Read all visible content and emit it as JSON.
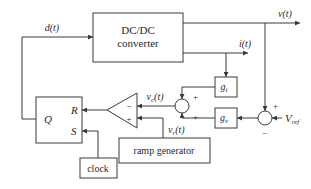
{
  "diagram": {
    "type": "block-diagram",
    "blocks": {
      "converter": {
        "line1": "DC/DC",
        "line2": "converter"
      },
      "latch": {
        "q": "Q",
        "r": "R",
        "s": "S"
      },
      "comparator": {
        "minus": "−",
        "plus": "+"
      },
      "gi": {
        "label": "g",
        "sub": "i"
      },
      "gv": {
        "label": "g",
        "sub": "v"
      },
      "ramp": {
        "label": "ramp generator"
      },
      "clock": {
        "label": "clock"
      }
    },
    "junction_current": {
      "top_sign": "+",
      "bottom_sign": "+"
    },
    "junction_voltage": {
      "top_sign": "+",
      "bottom_sign": "−"
    },
    "signals": {
      "d": "d(t)",
      "v": "v(t)",
      "i": "i(t)",
      "vc": "v",
      "vc_sub": "c",
      "vc_arg": "(t)",
      "vr": "v",
      "vr_sub": "r",
      "vr_arg": "(t)",
      "vref": "V",
      "vref_sub": "ref"
    }
  }
}
